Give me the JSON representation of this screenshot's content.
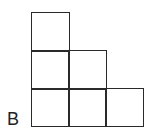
{
  "figure": {
    "label": "B",
    "rows": [
      {
        "row": 1,
        "squares": 1
      },
      {
        "row": 2,
        "squares": 2
      },
      {
        "row": 3,
        "squares": 3
      }
    ],
    "total_squares": 6,
    "line_color": "#2a2a2a",
    "background_color": "#ffffff"
  }
}
